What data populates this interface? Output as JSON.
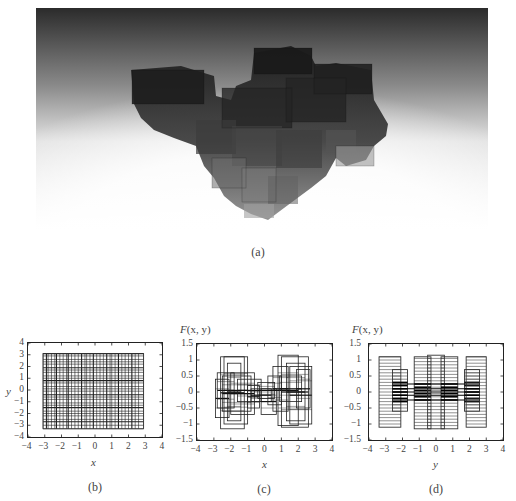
{
  "figure": {
    "panels": [
      {
        "id": "a",
        "caption": "(a)",
        "description": "3D rendering of stacked translucent boxes on a gradient background"
      },
      {
        "id": "b",
        "caption": "(b)"
      },
      {
        "id": "c",
        "caption": "(c)"
      },
      {
        "id": "d",
        "caption": "(d)"
      }
    ]
  },
  "chart_data": [
    {
      "panel": "b",
      "type": "scatter",
      "subtype": "rectangle-partition",
      "title": "",
      "xlabel": "x",
      "ylabel": "y",
      "xlim": [
        -4,
        4
      ],
      "ylim": [
        -4,
        4
      ],
      "xticks": [
        "-4",
        "-3",
        "-2",
        "-1",
        "0",
        "1",
        "2",
        "3",
        "4"
      ],
      "yticks": [
        "4",
        "3",
        "2",
        "1",
        "0",
        "-1",
        "-2",
        "-3",
        "-4"
      ],
      "grid": false,
      "extent": {
        "x": [
          -3.1,
          2.9
        ],
        "y": [
          -3.3,
          3.1
        ]
      },
      "vertical_lines": [
        -3.1,
        -2.9,
        -2.8,
        -2.6,
        -2.4,
        -2.3,
        -2.1,
        -1.9,
        -1.7,
        -1.6,
        -1.4,
        -1.2,
        -1.0,
        -0.8,
        -0.6,
        -0.5,
        -0.3,
        -0.1,
        0.1,
        0.3,
        0.5,
        0.7,
        0.9,
        1.0,
        1.2,
        1.4,
        1.6,
        1.8,
        2.0,
        2.2,
        2.4,
        2.6,
        2.9
      ],
      "horizontal_lines": [
        -3.3,
        -3.0,
        -2.7,
        -2.5,
        -2.2,
        -2.0,
        -1.8,
        -1.5,
        -1.3,
        -1.1,
        -0.8,
        -0.6,
        -0.4,
        -0.1,
        0.1,
        0.3,
        0.6,
        0.8,
        1.0,
        1.2,
        1.5,
        1.7,
        1.9,
        2.2,
        2.4,
        2.6,
        2.9,
        3.1
      ]
    },
    {
      "panel": "c",
      "type": "scatter",
      "subtype": "rectangle-projection",
      "title": "",
      "xlabel": "x",
      "ylabel": "F(x, y)",
      "xlim": [
        -4,
        4
      ],
      "ylim": [
        -1.5,
        1.5
      ],
      "xticks": [
        "-4",
        "-3",
        "-2",
        "-1",
        "0",
        "1",
        "2",
        "3",
        "4"
      ],
      "yticks": [
        "1.5",
        "1",
        "0.5",
        "0",
        "-0.5",
        "-1",
        "-1.5"
      ],
      "grid": false,
      "rectangles": [
        [
          -2.9,
          -0.8,
          -2.1,
          0.4
        ],
        [
          -2.8,
          -0.5,
          -1.8,
          0.6
        ],
        [
          -2.6,
          -1.15,
          -1.2,
          1.1
        ],
        [
          -2.4,
          -1.0,
          -1.0,
          1.1
        ],
        [
          -2.2,
          -0.9,
          -1.4,
          0.9
        ],
        [
          -2.5,
          -0.6,
          -0.8,
          0.5
        ],
        [
          -2.0,
          -0.7,
          -0.6,
          0.6
        ],
        [
          -1.6,
          -0.3,
          -0.2,
          0.4
        ],
        [
          -1.0,
          -0.5,
          -0.3,
          0.2
        ],
        [
          -0.8,
          -0.3,
          0.4,
          0.1
        ],
        [
          -0.4,
          -0.2,
          0.6,
          0.3
        ],
        [
          -0.2,
          -0.7,
          0.7,
          0.1
        ],
        [
          0.2,
          -0.4,
          1.0,
          0.5
        ],
        [
          0.5,
          -0.6,
          1.4,
          0.8
        ],
        [
          0.8,
          -1.05,
          2.0,
          1.15
        ],
        [
          1.0,
          -1.1,
          2.6,
          1.1
        ],
        [
          1.3,
          -0.9,
          2.4,
          0.9
        ],
        [
          1.5,
          -1.0,
          2.8,
          0.8
        ],
        [
          1.9,
          -0.5,
          2.7,
          0.7
        ],
        [
          0.9,
          -0.3,
          2.2,
          0.5
        ]
      ]
    },
    {
      "panel": "d",
      "type": "scatter",
      "subtype": "rectangle-projection",
      "title": "",
      "xlabel": "y",
      "ylabel": "F(x, y)",
      "xlim": [
        -4,
        4
      ],
      "ylim": [
        -1.5,
        1.5
      ],
      "xticks": [
        "-4",
        "-3",
        "-2",
        "-1",
        "0",
        "1",
        "2",
        "3",
        "4"
      ],
      "yticks": [
        "1.5",
        "1",
        "0.5",
        "0",
        "-0.5",
        "-1",
        "-1.5"
      ],
      "grid": false,
      "column_groups": [
        {
          "x": [
            -3.4,
            -2.1
          ],
          "y": [
            -1.1,
            1.1
          ]
        },
        {
          "x": [
            -2.6,
            -1.7
          ],
          "y": [
            -0.6,
            0.7
          ]
        },
        {
          "x": [
            -1.3,
            -0.3
          ],
          "y": [
            -1.15,
            1.1
          ]
        },
        {
          "x": [
            -0.5,
            0.5
          ],
          "y": [
            -1.15,
            1.15
          ]
        },
        {
          "x": [
            0.3,
            1.3
          ],
          "y": [
            -1.15,
            1.1
          ]
        },
        {
          "x": [
            1.7,
            2.6
          ],
          "y": [
            -0.6,
            0.7
          ]
        },
        {
          "x": [
            1.8,
            3.0
          ],
          "y": [
            -1.1,
            1.1
          ]
        }
      ]
    }
  ],
  "panel_b": {
    "ylabel": "y",
    "xlabel": "x",
    "caption": "(b)"
  },
  "panel_c": {
    "ylabel_f": "F",
    "ylabel_args": "(x, y)",
    "xlabel": "x",
    "caption": "(c)"
  },
  "panel_d": {
    "ylabel_f": "F",
    "ylabel_args": "(x, y)",
    "xlabel": "y",
    "caption": "(d)"
  },
  "panel_a": {
    "caption": "(a)"
  }
}
